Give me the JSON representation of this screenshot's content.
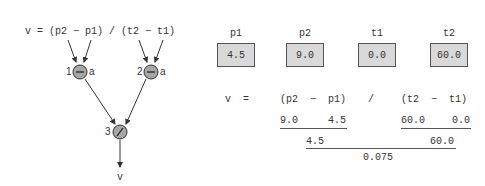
{
  "graph": {
    "formula": "v = (p2 − p1) / (t2 − t1)",
    "nodes": [
      {
        "id": "1",
        "op": "−",
        "annot": "a"
      },
      {
        "id": "2",
        "op": "−",
        "annot": "a"
      },
      {
        "id": "3",
        "op": "/"
      }
    ],
    "output": "v",
    "node_fill": "#a6a6a6"
  },
  "variables": [
    {
      "name": "p1",
      "value": "4.5"
    },
    {
      "name": "p2",
      "value": "9.0"
    },
    {
      "name": "t1",
      "value": "0.0"
    },
    {
      "name": "t2",
      "value": "60.0"
    }
  ],
  "evaluation": {
    "equation": {
      "lhs": "v",
      "eq": "=",
      "num": "(p2  −  p1)",
      "div": "/",
      "den": "(t2  −  t1)"
    },
    "step1": {
      "a": "9.0",
      "b": "4.5",
      "c": "60.0",
      "d": "0.0"
    },
    "step2": {
      "num": "4.5",
      "den": "60.0"
    },
    "result": "0.075"
  }
}
